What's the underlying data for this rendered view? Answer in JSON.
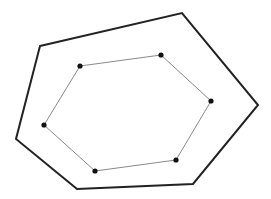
{
  "canvas": {
    "width": 271,
    "height": 199,
    "background": "#ffffff"
  },
  "diagram": {
    "outer_polygon": {
      "stroke": "#222222",
      "stroke_width": 2,
      "points": [
        [
          40,
          46
        ],
        [
          182,
          13
        ],
        [
          258,
          105
        ],
        [
          193,
          184
        ],
        [
          77,
          189
        ],
        [
          16,
          139
        ]
      ]
    },
    "inner_polygon": {
      "stroke": "#8a8a8a",
      "stroke_width": 1,
      "points": [
        [
          80,
          66
        ],
        [
          161,
          55
        ],
        [
          211,
          101
        ],
        [
          176,
          160
        ],
        [
          95,
          171
        ],
        [
          44,
          125
        ]
      ],
      "vertex_dot": {
        "fill": "#111111",
        "radius": 2.6
      }
    }
  }
}
